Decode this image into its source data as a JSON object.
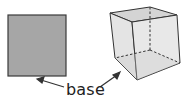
{
  "diagram": {
    "label": "base",
    "shapes": [
      "square",
      "cube"
    ],
    "colors": {
      "square_fill": "#a6a6a6",
      "square_stroke": "#3a3a3a",
      "cube_fill": "#dcdcdc",
      "cube_stroke": "#333333",
      "text": "#222222"
    }
  }
}
